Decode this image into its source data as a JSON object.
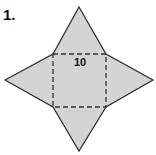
{
  "problem_number": "1.",
  "figure": {
    "type": "square pyramid net",
    "base_side_label": "10",
    "fill_color": "#d4d4d4",
    "stroke_color": "#2a2a2a"
  }
}
